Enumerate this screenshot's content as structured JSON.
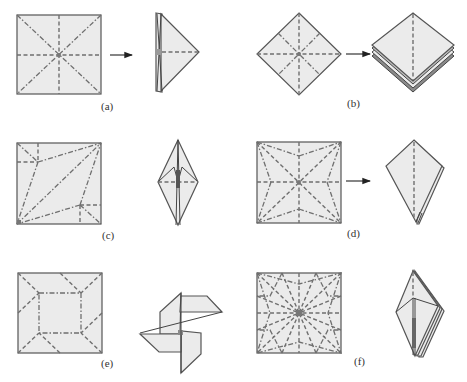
{
  "figure": {
    "colors": {
      "paper_fill": "#ebebeb",
      "outline": "#555555",
      "crease": "#6f6f6f",
      "dark_layer": "#8a8a8a",
      "arrow": "#222222"
    },
    "panels": [
      {
        "id": "a",
        "label": "(a)",
        "crease_pattern": "square with horizontal/vertical valley folds and diagonal mountain folds",
        "folded_result": "flat triangular base (side view)"
      },
      {
        "id": "b",
        "label": "(b)",
        "crease_pattern": "square on point (diamond) with valley diagonals and mountain midlines",
        "folded_result": "preliminary base (square base, layered)"
      },
      {
        "id": "c",
        "label": "(c)",
        "crease_pattern": "square with asymmetric diagonal and edge creases",
        "folded_result": "bird-base-like diamond"
      },
      {
        "id": "d",
        "label": "(d)",
        "crease_pattern": "square with star-shaped crease pattern",
        "folded_result": "kite-shaped layered flap"
      },
      {
        "id": "e",
        "label": "(e)",
        "crease_pattern": "square with inner square and corner diagonals",
        "folded_result": "pinwheel"
      },
      {
        "id": "f",
        "label": "(f)",
        "crease_pattern": "square with dense radial star crease pattern",
        "folded_result": "multi-flap layered diamond base"
      }
    ],
    "caption_partial": ""
  }
}
